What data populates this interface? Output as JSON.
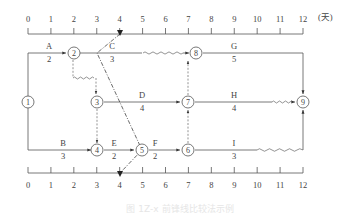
{
  "diagram": {
    "type": "time-scaled network schedule with progress check lines",
    "time_unit_label": "(天)",
    "axis_ticks": [
      "0",
      "1",
      "2",
      "3",
      "4",
      "5",
      "6",
      "7",
      "8",
      "9",
      "10",
      "11",
      "12"
    ],
    "check_time": "4",
    "nodes": [
      {
        "id": "1",
        "label": "1"
      },
      {
        "id": "2",
        "label": "2"
      },
      {
        "id": "3",
        "label": "3"
      },
      {
        "id": "4",
        "label": "4"
      },
      {
        "id": "5",
        "label": "5"
      },
      {
        "id": "6",
        "label": "6"
      },
      {
        "id": "7",
        "label": "7"
      },
      {
        "id": "8",
        "label": "8"
      },
      {
        "id": "9",
        "label": "9"
      }
    ],
    "activities": [
      {
        "name": "A",
        "duration": "2",
        "from": "1",
        "to": "2"
      },
      {
        "name": "B",
        "duration": "3",
        "from": "1",
        "to": "4"
      },
      {
        "name": "C",
        "duration": "3",
        "from": "2",
        "to": "8"
      },
      {
        "name": "D",
        "duration": "4",
        "from": "3",
        "to": "7"
      },
      {
        "name": "E",
        "duration": "2",
        "from": "4",
        "to": "5"
      },
      {
        "name": "F",
        "duration": "2",
        "from": "5",
        "to": "6"
      },
      {
        "name": "G",
        "duration": "5",
        "from": "8",
        "to": "9"
      },
      {
        "name": "H",
        "duration": "4",
        "from": "7",
        "to": "9"
      },
      {
        "name": "I",
        "duration": "3",
        "from": "6",
        "to": "9"
      }
    ],
    "caption": "图 1Z-x 前锋线比较法示例"
  }
}
